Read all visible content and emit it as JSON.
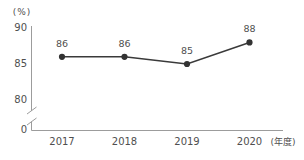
{
  "chart_data": {
    "type": "line",
    "title": "",
    "categories": [
      "2017",
      "2018",
      "2019",
      "2020"
    ],
    "values": [
      86,
      86,
      85,
      88
    ],
    "data_labels": [
      "86",
      "86",
      "85",
      "88"
    ],
    "xlabel": "(年度)",
    "ylabel": "(%)",
    "y_ticks": [
      90,
      85,
      80
    ],
    "origin_tick": "0",
    "axis_break": true,
    "ylim_display": [
      80,
      90
    ],
    "ylim_full": [
      0,
      90
    ],
    "grid": false,
    "legend": "none",
    "marker": "filled-circle",
    "colors": {
      "line": "#3a3a3a",
      "marker": "#333333",
      "axis": "#9c9c9c",
      "text": "#4f4f4f"
    }
  }
}
